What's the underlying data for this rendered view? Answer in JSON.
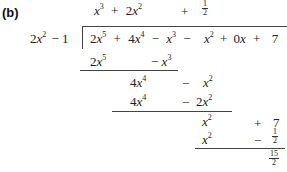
{
  "label": "(b)",
  "divisor": {
    "coef": "2",
    "var": "x",
    "exp": "2",
    "rest": "− 1"
  },
  "quotient": {
    "t1": {
      "var": "x",
      "exp": "3"
    },
    "op1": "+",
    "t2": {
      "coef": "2",
      "var": "x",
      "exp": "2"
    },
    "op2": "+",
    "t3": {
      "num": "1",
      "den": "2"
    }
  },
  "dividend": {
    "t1": {
      "coef": "2",
      "var": "x",
      "exp": "5"
    },
    "op1": "+",
    "t2": {
      "coef": "4",
      "var": "x",
      "exp": "4"
    },
    "op2": "−",
    "t3": {
      "var": "x",
      "exp": "3"
    },
    "op3": "−",
    "t4": {
      "var": "x",
      "exp": "2"
    },
    "op4": "+",
    "t5": {
      "coef": "0",
      "var": "x"
    },
    "op5": "+",
    "t6": "7"
  },
  "steps": {
    "s1": {
      "t1": {
        "coef": "2",
        "var": "x",
        "exp": "5"
      },
      "op": "−",
      "t2": {
        "var": "x",
        "exp": "3"
      }
    },
    "r1": {
      "t1": {
        "coef": "4",
        "var": "x",
        "exp": "4"
      },
      "op": "−",
      "t2": {
        "var": "x",
        "exp": "2"
      }
    },
    "s2": {
      "t1": {
        "coef": "4",
        "var": "x",
        "exp": "4"
      },
      "op": "−",
      "t2": {
        "coef": "2",
        "var": "x",
        "exp": "2"
      }
    },
    "r2": {
      "t1": {
        "var": "x",
        "exp": "2"
      },
      "op": "+",
      "t2": "7"
    },
    "s3": {
      "t1": {
        "var": "x",
        "exp": "2"
      },
      "op": "−",
      "t2": {
        "num": "1",
        "den": "2"
      }
    },
    "remainder": {
      "num": "15",
      "den": "2"
    }
  }
}
